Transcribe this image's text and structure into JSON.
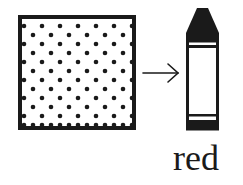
{
  "figure": {
    "pattern_square": {
      "pattern": "dots",
      "border_color": "#1a1a1a",
      "dot_color": "#1a1a1a",
      "fill_color": "#ffffff"
    },
    "arrow": {
      "direction": "right",
      "icon": "arrow-right-icon"
    },
    "crayon": {
      "icon": "crayon-icon",
      "outline_color": "#1a1a1a"
    },
    "label": "red"
  }
}
